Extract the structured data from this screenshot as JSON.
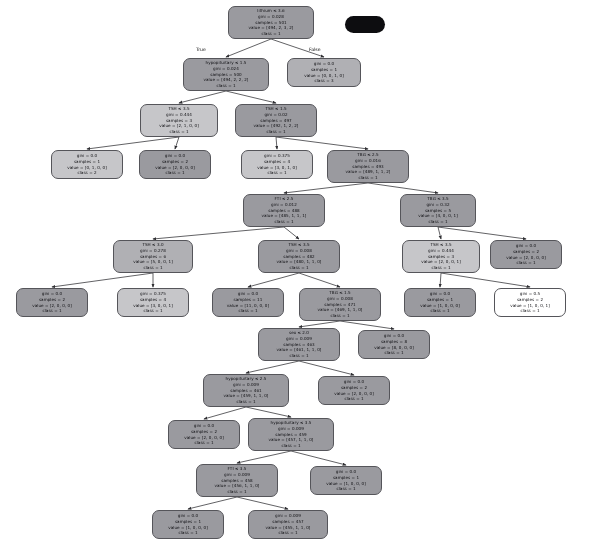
{
  "diagram": {
    "type": "decision-tree",
    "criterion": "gini",
    "classes": [
      "1",
      "2",
      "3",
      "4"
    ],
    "features": [
      "lithium",
      "hypopituitary",
      "TSH",
      "TBG",
      "FTI",
      "sex"
    ],
    "branch_labels": {
      "left": "True",
      "right": "False"
    },
    "colors": {
      "node_fill_dark": "#9a9a9f",
      "node_fill_mid": "#b0b0b4",
      "node_fill_light": "#c6c6c9",
      "node_fill_white": "#ffffff",
      "node_border": "#55555a",
      "edge": "#3a3a3e",
      "background": "#ffffff",
      "blob": "#0d0d10"
    },
    "nodes": [
      {
        "id": "n0",
        "x": 228,
        "y": 6,
        "w": 86,
        "h": 33,
        "fill": "#9a9a9f",
        "lines": [
          "lithium ≤ 3.6",
          "gini = 0.028",
          "samples = 501",
          "value = [494, 2, 3, 2]",
          "class = 1"
        ]
      },
      {
        "id": "n1",
        "x": 183,
        "y": 58,
        "w": 86,
        "h": 33,
        "fill": "#9a9a9f",
        "lines": [
          "hypopituitary ≤ 1.5",
          "gini = 0.024",
          "samples = 500",
          "value = [494, 2, 2, 2]",
          "class = 1"
        ]
      },
      {
        "id": "n2",
        "x": 287,
        "y": 58,
        "w": 74,
        "h": 29,
        "fill": "#b0b0b4",
        "lines": [
          "gini = 0.0",
          "samples = 1",
          "value = [0, 0, 1, 0]",
          "class = 3"
        ]
      },
      {
        "id": "n3",
        "x": 140,
        "y": 104,
        "w": 78,
        "h": 33,
        "fill": "#c6c6c9",
        "lines": [
          "TSH ≤ 3.5",
          "gini = 0.444",
          "samples = 3",
          "value = [2, 1, 0, 0]",
          "class = 1"
        ]
      },
      {
        "id": "n4",
        "x": 235,
        "y": 104,
        "w": 82,
        "h": 33,
        "fill": "#9a9a9f",
        "lines": [
          "TSH ≤ 1.5",
          "gini = 0.02",
          "samples = 497",
          "value = [492, 1, 2, 2]",
          "class = 1"
        ]
      },
      {
        "id": "n5",
        "x": 51,
        "y": 150,
        "w": 72,
        "h": 29,
        "fill": "#c6c6c9",
        "lines": [
          "gini = 0.0",
          "samples = 1",
          "value = [0, 1, 0, 0]",
          "class = 2"
        ]
      },
      {
        "id": "n6",
        "x": 139,
        "y": 150,
        "w": 72,
        "h": 29,
        "fill": "#9a9a9f",
        "lines": [
          "gini = 0.0",
          "samples = 2",
          "value = [2, 0, 0, 0]",
          "class = 1"
        ]
      },
      {
        "id": "n7",
        "x": 241,
        "y": 150,
        "w": 72,
        "h": 29,
        "fill": "#c6c6c9",
        "lines": [
          "gini = 0.375",
          "samples = 4",
          "value = [3, 0, 1, 0]",
          "class = 1"
        ]
      },
      {
        "id": "n8",
        "x": 327,
        "y": 150,
        "w": 82,
        "h": 33,
        "fill": "#9a9a9f",
        "lines": [
          "TBG ≤ 2.5",
          "gini = 0.016",
          "samples = 493",
          "value = [489, 1, 1, 2]",
          "class = 1"
        ]
      },
      {
        "id": "n9",
        "x": 243,
        "y": 194,
        "w": 82,
        "h": 33,
        "fill": "#9a9a9f",
        "lines": [
          "FTI ≤ 2.5",
          "gini = 0.012",
          "samples = 488",
          "value = [485, 1, 1, 1]",
          "class = 1"
        ]
      },
      {
        "id": "n10",
        "x": 400,
        "y": 194,
        "w": 76,
        "h": 33,
        "fill": "#9a9a9f",
        "lines": [
          "TBG ≤ 3.5",
          "gini = 0.32",
          "samples = 5",
          "value = [4, 0, 0, 1]",
          "class = 1"
        ]
      },
      {
        "id": "n11",
        "x": 113,
        "y": 240,
        "w": 80,
        "h": 33,
        "fill": "#b0b0b4",
        "lines": [
          "TSH ≤ 3.0",
          "gini = 0.278",
          "samples = 6",
          "value = [5, 0, 0, 1]",
          "class = 1"
        ]
      },
      {
        "id": "n12",
        "x": 258,
        "y": 240,
        "w": 82,
        "h": 33,
        "fill": "#9a9a9f",
        "lines": [
          "TSH ≤ 3.5",
          "gini = 0.008",
          "samples = 482",
          "value = [480, 1, 1, 0]",
          "class = 1"
        ]
      },
      {
        "id": "n13",
        "x": 402,
        "y": 240,
        "w": 78,
        "h": 33,
        "fill": "#c6c6c9",
        "lines": [
          "TSH ≤ 3.5",
          "gini = 0.444",
          "samples = 3",
          "value = [2, 0, 0, 1]",
          "class = 1"
        ]
      },
      {
        "id": "n14",
        "x": 490,
        "y": 240,
        "w": 72,
        "h": 29,
        "fill": "#9a9a9f",
        "lines": [
          "gini = 0.0",
          "samples = 2",
          "value = [2, 0, 0, 0]",
          "class = 1"
        ]
      },
      {
        "id": "n15",
        "x": 16,
        "y": 288,
        "w": 72,
        "h": 29,
        "fill": "#9a9a9f",
        "lines": [
          "gini = 0.0",
          "samples = 2",
          "value = [2, 0, 0, 0]",
          "class = 1"
        ]
      },
      {
        "id": "n16",
        "x": 117,
        "y": 288,
        "w": 72,
        "h": 29,
        "fill": "#c6c6c9",
        "lines": [
          "gini = 0.375",
          "samples = 4",
          "value = [3, 0, 0, 1]",
          "class = 1"
        ]
      },
      {
        "id": "n17",
        "x": 212,
        "y": 288,
        "w": 72,
        "h": 29,
        "fill": "#9a9a9f",
        "lines": [
          "gini = 0.0",
          "samples = 11",
          "value = [11, 0, 0, 0]",
          "class = 1"
        ]
      },
      {
        "id": "n18",
        "x": 299,
        "y": 288,
        "w": 82,
        "h": 33,
        "fill": "#9a9a9f",
        "lines": [
          "TBG ≤ 1.5",
          "gini = 0.008",
          "samples = 471",
          "value = [469, 1, 1, 0]",
          "class = 1"
        ]
      },
      {
        "id": "n19",
        "x": 404,
        "y": 288,
        "w": 72,
        "h": 29,
        "fill": "#9a9a9f",
        "lines": [
          "gini = 0.0",
          "samples = 1",
          "value = [1, 0, 0, 0]",
          "class = 1"
        ]
      },
      {
        "id": "n20",
        "x": 494,
        "y": 288,
        "w": 72,
        "h": 29,
        "fill": "#ffffff",
        "lines": [
          "gini = 0.5",
          "samples = 2",
          "value = [1, 0, 0, 1]",
          "class = 1"
        ]
      },
      {
        "id": "n21",
        "x": 258,
        "y": 328,
        "w": 82,
        "h": 33,
        "fill": "#9a9a9f",
        "lines": [
          "sex ≤ 2.0",
          "gini = 0.009",
          "samples = 463",
          "value = [461, 1, 1, 0]",
          "class = 1"
        ]
      },
      {
        "id": "n22",
        "x": 358,
        "y": 330,
        "w": 72,
        "h": 29,
        "fill": "#9a9a9f",
        "lines": [
          "gini = 0.0",
          "samples = 8",
          "value = [8, 0, 0, 0]",
          "class = 1"
        ]
      },
      {
        "id": "n23",
        "x": 203,
        "y": 374,
        "w": 86,
        "h": 33,
        "fill": "#9a9a9f",
        "lines": [
          "hypopituitary ≤ 2.5",
          "gini = 0.009",
          "samples = 461",
          "value = [459, 1, 1, 0]",
          "class = 1"
        ]
      },
      {
        "id": "n24",
        "x": 318,
        "y": 376,
        "w": 72,
        "h": 29,
        "fill": "#9a9a9f",
        "lines": [
          "gini = 0.0",
          "samples = 2",
          "value = [2, 0, 0, 0]",
          "class = 1"
        ]
      },
      {
        "id": "n25",
        "x": 168,
        "y": 420,
        "w": 72,
        "h": 29,
        "fill": "#9a9a9f",
        "lines": [
          "gini = 0.0",
          "samples = 2",
          "value = [2, 0, 0, 0]",
          "class = 1"
        ]
      },
      {
        "id": "n26",
        "x": 248,
        "y": 418,
        "w": 86,
        "h": 33,
        "fill": "#9a9a9f",
        "lines": [
          "hypopituitary ≤ 3.5",
          "gini = 0.009",
          "samples = 459",
          "value = [457, 1, 1, 0]",
          "class = 1"
        ]
      },
      {
        "id": "n27",
        "x": 196,
        "y": 464,
        "w": 82,
        "h": 33,
        "fill": "#9a9a9f",
        "lines": [
          "FTI ≤ 3.5",
          "gini = 0.009",
          "samples = 458",
          "value = [456, 1, 1, 0]",
          "class = 1"
        ]
      },
      {
        "id": "n28",
        "x": 310,
        "y": 466,
        "w": 72,
        "h": 29,
        "fill": "#9a9a9f",
        "lines": [
          "gini = 0.0",
          "samples = 1",
          "value = [1, 0, 0, 0]",
          "class = 1"
        ]
      },
      {
        "id": "n29",
        "x": 152,
        "y": 510,
        "w": 72,
        "h": 29,
        "fill": "#9a9a9f",
        "lines": [
          "gini = 0.0",
          "samples = 1",
          "value = [1, 0, 0, 0]",
          "class = 1"
        ]
      },
      {
        "id": "n30",
        "x": 248,
        "y": 510,
        "w": 80,
        "h": 29,
        "fill": "#9a9a9f",
        "lines": [
          "gini = 0.009",
          "samples = 457",
          "value = [455, 1, 1, 0]",
          "class = 1"
        ]
      }
    ],
    "edges": [
      {
        "from": "n0",
        "to": "n1"
      },
      {
        "from": "n0",
        "to": "n2"
      },
      {
        "from": "n1",
        "to": "n3"
      },
      {
        "from": "n1",
        "to": "n4"
      },
      {
        "from": "n3",
        "to": "n5"
      },
      {
        "from": "n3",
        "to": "n6"
      },
      {
        "from": "n4",
        "to": "n7"
      },
      {
        "from": "n4",
        "to": "n8"
      },
      {
        "from": "n8",
        "to": "n9"
      },
      {
        "from": "n8",
        "to": "n10"
      },
      {
        "from": "n9",
        "to": "n11"
      },
      {
        "from": "n9",
        "to": "n12"
      },
      {
        "from": "n10",
        "to": "n13"
      },
      {
        "from": "n10",
        "to": "n14"
      },
      {
        "from": "n11",
        "to": "n15"
      },
      {
        "from": "n11",
        "to": "n16"
      },
      {
        "from": "n12",
        "to": "n17"
      },
      {
        "from": "n12",
        "to": "n18"
      },
      {
        "from": "n13",
        "to": "n19"
      },
      {
        "from": "n13",
        "to": "n20"
      },
      {
        "from": "n18",
        "to": "n21"
      },
      {
        "from": "n18",
        "to": "n22"
      },
      {
        "from": "n21",
        "to": "n23"
      },
      {
        "from": "n21",
        "to": "n24"
      },
      {
        "from": "n23",
        "to": "n25"
      },
      {
        "from": "n23",
        "to": "n26"
      },
      {
        "from": "n26",
        "to": "n27"
      },
      {
        "from": "n26",
        "to": "n28"
      },
      {
        "from": "n27",
        "to": "n29"
      },
      {
        "from": "n27",
        "to": "n30"
      }
    ],
    "edge_labels": [
      {
        "text": "True",
        "x": 196,
        "y": 47
      },
      {
        "text": "False",
        "x": 309,
        "y": 47
      }
    ]
  }
}
